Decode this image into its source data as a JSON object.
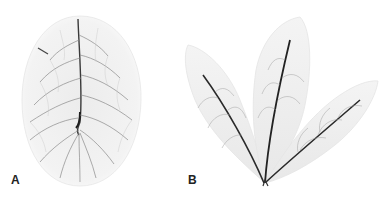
{
  "figure": {
    "panels": [
      {
        "label": "A",
        "subject": "single ovate leaf skeleton with pinnate venation"
      },
      {
        "label": "B",
        "subject": "three-leaflet compound leaf skeleton"
      }
    ],
    "colors": {
      "background": "#ffffff",
      "leaf_fill": "#f1f1f1",
      "vein_dark": "#2a2a2a",
      "vein_light": "#9a9a9a"
    }
  }
}
